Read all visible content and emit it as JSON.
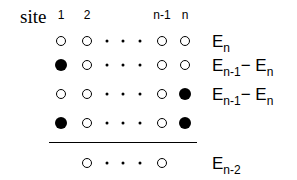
{
  "diagram": {
    "header_label": "site",
    "column_headers": [
      {
        "text": "1",
        "x": 61
      },
      {
        "text": "2",
        "x": 87
      },
      {
        "text": "n-1",
        "x": 162
      },
      {
        "text": "n",
        "x": 185
      }
    ],
    "rows": [
      {
        "y": 41,
        "site_1": "open",
        "site_2": "open",
        "site_n_minus_1": "open",
        "site_n": "open",
        "energy_main": "E",
        "energy_sub": "n",
        "energy_minus": "",
        "energy_main2": "",
        "energy_sub2": ""
      },
      {
        "y": 65,
        "site_1": "filled",
        "site_2": "open",
        "site_n_minus_1": "open",
        "site_n": "open",
        "energy_main": "E",
        "energy_sub": "n-1",
        "energy_minus": "−",
        "energy_main2": " E",
        "energy_sub2": "n"
      },
      {
        "y": 94,
        "site_1": "open",
        "site_2": "open",
        "site_n_minus_1": "open",
        "site_n": "filled",
        "energy_main": "E",
        "energy_sub": "n-1",
        "energy_minus": "−",
        "energy_main2": " E",
        "energy_sub2": "n"
      },
      {
        "y": 123,
        "site_1": "filled",
        "site_2": "open",
        "site_n_minus_1": "open",
        "site_n": "filled",
        "energy_main": "",
        "energy_sub": "",
        "energy_minus": "",
        "energy_main2": "",
        "energy_sub2": ""
      }
    ],
    "separator": true,
    "bottom_row": {
      "y": 163,
      "left": "open",
      "right": "open",
      "energy_main": "E",
      "energy_sub": "n-2"
    },
    "legend_note": "open circle = empty site, filled circle = occupied site, dots = intermediate sites"
  }
}
